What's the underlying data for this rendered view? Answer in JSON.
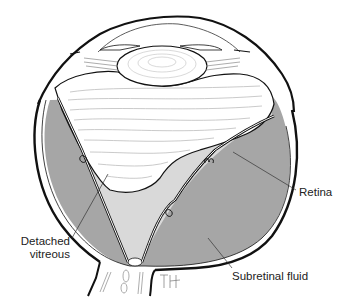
{
  "diagram": {
    "type": "anatomical-illustration",
    "signature": "TH",
    "labels": [
      {
        "id": "retina",
        "text": "Retina"
      },
      {
        "id": "detached-vitreous",
        "line1": "Detached",
        "line2": "vitreous"
      },
      {
        "id": "subretinal-fluid",
        "text": "Subretinal fluid"
      }
    ],
    "colors": {
      "outline": "#111111",
      "subretinal_fluid": "#a6a6a6",
      "vitreous_space": "#d9d9d9",
      "vitreous_gel": "#ffffff",
      "fiber_lines": "#bdbdbd",
      "background": "#ffffff"
    }
  }
}
